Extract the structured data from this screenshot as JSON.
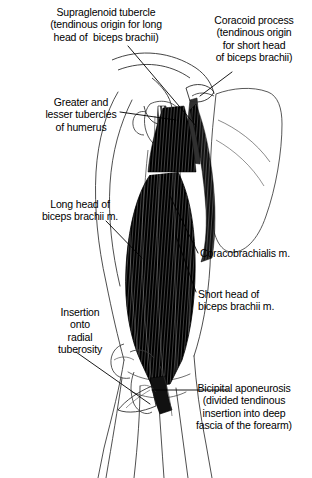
{
  "figure": {
    "style": "black-and-white pen-and-ink anatomical drawing",
    "background_color": "#ffffff",
    "ink_color": "#000000",
    "muscle_shading_color": "#111111",
    "bone_outline_color": "#3a3a3a"
  },
  "labels": {
    "supraglenoid": "Supraglenoid tubercle\n(tendinous origin for long\nhead of  biceps brachii)",
    "coracoid": "Coracoid process\n(tendinous origin\nfor short head\nof biceps brachii)",
    "tubercles": "Greater and\nlesser tubercles\nof humerus",
    "long_head": "Long head of\nbiceps brachii m.",
    "insertion": "Insertion\nonto\nradial\ntuberosity",
    "coracobrachialis": "Coracobrachialis m.",
    "short_head": "Short head of\nbiceps brachii m.",
    "aponeurosis": "Bicipital aponeurosis\n(divided tendinous\ninsertion into deep\nfascia of the forearm)"
  },
  "structures": [
    "supraglenoid tubercle",
    "coracoid process",
    "greater tubercle of humerus",
    "lesser tubercle of humerus",
    "long head of biceps brachii",
    "short head of biceps brachii",
    "coracobrachialis muscle",
    "scapula",
    "humerus",
    "radial tuberosity",
    "bicipital aponeurosis",
    "forearm"
  ]
}
